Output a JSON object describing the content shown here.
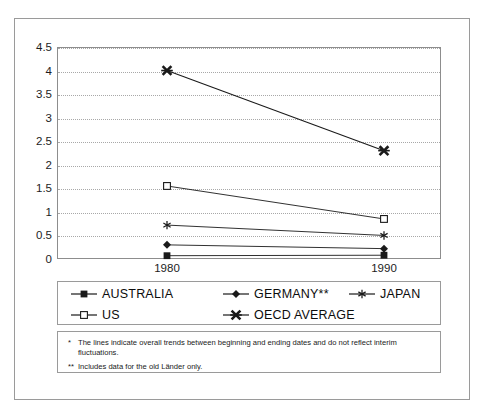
{
  "chart_data": {
    "type": "line",
    "title": "",
    "subtitle": "",
    "xlabel": "",
    "ylabel": "",
    "x": [
      "1980",
      "1990"
    ],
    "categories": [
      "1980",
      "1990"
    ],
    "xlim": [
      "1980",
      "1990"
    ],
    "ylim": [
      0,
      4.5
    ],
    "yticks": [
      "0",
      "0.5",
      "1",
      "1.5",
      "2",
      "2.5",
      "3",
      "3.5",
      "4",
      "4.5"
    ],
    "ytick_values": [
      0,
      0.5,
      1,
      1.5,
      2,
      2.5,
      3,
      3.5,
      4,
      4.5
    ],
    "grid": "horizontal-dotted",
    "legend_position": "below-plot",
    "series": [
      {
        "name": "AUSTRALIA",
        "marker": "filled-square",
        "values": [
          0.07,
          0.08
        ]
      },
      {
        "name": "GERMANY**",
        "marker": "filled-diamond",
        "values": [
          0.3,
          0.22
        ]
      },
      {
        "name": "JAPAN",
        "marker": "asterisk",
        "values": [
          0.72,
          0.5
        ]
      },
      {
        "name": "US",
        "marker": "hollow-square",
        "values": [
          1.55,
          0.85
        ]
      },
      {
        "name": "OECD AVERAGE",
        "marker": "bold-x",
        "values": [
          4.0,
          2.3
        ]
      }
    ],
    "colors": {
      "line": "#1a1a1a",
      "grid": "#a8a8a8",
      "axis": "#8d8d8d",
      "text": "#111111",
      "background": "#ffffff"
    }
  },
  "axes": {
    "y_tick_labels": [
      "4.5",
      "4",
      "3.5",
      "3",
      "2.5",
      "2",
      "1.5",
      "1",
      "0.5",
      "0"
    ],
    "x_tick_labels": [
      "1980",
      "1990"
    ]
  },
  "legend": {
    "rows": [
      [
        {
          "label": "AUSTRALIA",
          "marker": "filled-square"
        },
        {
          "label": "GERMANY**",
          "marker": "filled-diamond"
        },
        {
          "label": "JAPAN",
          "marker": "asterisk"
        }
      ],
      [
        {
          "label": "US",
          "marker": "hollow-square"
        },
        {
          "label": "OECD AVERAGE",
          "marker": "bold-x"
        }
      ]
    ]
  },
  "footnotes": [
    {
      "mark": "*",
      "text": "The lines indicate overall trends between beginning and ending dates and do not reflect interim fluctuations."
    },
    {
      "mark": "**",
      "text": "Includes data for the old Länder only."
    }
  ]
}
